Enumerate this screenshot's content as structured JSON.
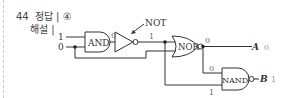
{
  "header": {
    "question_number": "44",
    "answer_label": "정답 | ④",
    "explanation_label": "해설 |"
  },
  "circuit": {
    "inputs": [
      {
        "name": "in1",
        "value": "1"
      },
      {
        "name": "in2",
        "value": "0"
      }
    ],
    "gates": {
      "and": {
        "label": "AND",
        "output_value": "0"
      },
      "not": {
        "label": "NOT",
        "output_value": "1"
      },
      "nor": {
        "label": "NOR",
        "output_value": "0"
      },
      "nand": {
        "label": "NAND",
        "top_input_value": "0",
        "bottom_input_value": "1"
      }
    },
    "outputs": [
      {
        "name": "A",
        "value": "0"
      },
      {
        "name": "B",
        "value": "1"
      }
    ]
  },
  "colors": {
    "line": "#333333",
    "text": "#333333",
    "value_gray": "#999999"
  }
}
